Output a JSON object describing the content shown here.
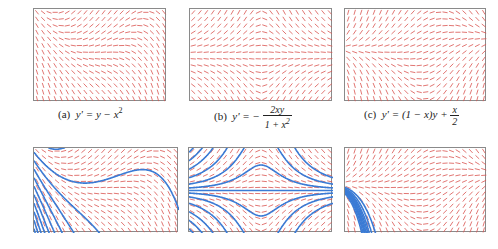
{
  "figure": {
    "colors": {
      "slope_segments": "#d9534f",
      "solution_curves": "#3a7bd5",
      "frame": "#8a8a8a"
    },
    "panels": [
      {
        "id": "a",
        "label": "(a)",
        "equation_lhs": "y' =",
        "equation_rhs": "y − x",
        "exponent": "2",
        "ode": "y - x^2",
        "xrange": [
          -2,
          2
        ],
        "yrange": [
          -2,
          2
        ],
        "solution_starts": [
          [
            -2,
            1.8
          ],
          [
            -2,
            1.4
          ],
          [
            -2,
            1.0
          ],
          [
            -2,
            0.6
          ],
          [
            -2,
            0.2
          ],
          [
            -2,
            -0.2
          ],
          [
            -2,
            -0.6
          ],
          [
            -2,
            -1.0
          ],
          [
            -2,
            -1.4
          ],
          [
            -2,
            -1.8
          ],
          [
            -1.6,
            2.0
          ],
          [
            -1.2,
            2.0
          ]
        ]
      },
      {
        "id": "b",
        "label": "(b)",
        "equation_lhs": "y' = −",
        "fraction_num": "2xy",
        "fraction_den": "1 + x",
        "den_exponent": "2",
        "ode": "-2*x*y/(1+x^2)",
        "xrange": [
          -3,
          3
        ],
        "yrange": [
          -2,
          2
        ],
        "solution_starts": [
          [
            -3,
            1.8
          ],
          [
            -3,
            1.4
          ],
          [
            -3,
            1.0
          ],
          [
            -3,
            0.6
          ],
          [
            -3,
            0.3
          ],
          [
            -3,
            0.12
          ],
          [
            -3,
            0.0
          ],
          [
            -3,
            -0.12
          ],
          [
            -3,
            -0.3
          ],
          [
            -3,
            -0.6
          ],
          [
            -3,
            -1.0
          ],
          [
            -3,
            -1.4
          ],
          [
            -3,
            -1.8
          ]
        ]
      },
      {
        "id": "c",
        "label": "(c)",
        "equation_lhs": "y' = (1 − x)y +",
        "fraction_num": "x",
        "fraction_den": "2",
        "ode": "(1-x)*y + x/2",
        "xrange": [
          -2,
          3
        ],
        "yrange": [
          -2,
          2
        ],
        "solution_starts": [
          [
            -2,
            0.0
          ],
          [
            -2,
            0.03
          ],
          [
            -2,
            -0.03
          ],
          [
            -2,
            0.06
          ],
          [
            -2,
            -0.06
          ],
          [
            -2,
            0.1
          ],
          [
            -2,
            -0.1
          ],
          [
            -2,
            -0.15
          ],
          [
            -2,
            0.15
          ]
        ]
      }
    ]
  }
}
